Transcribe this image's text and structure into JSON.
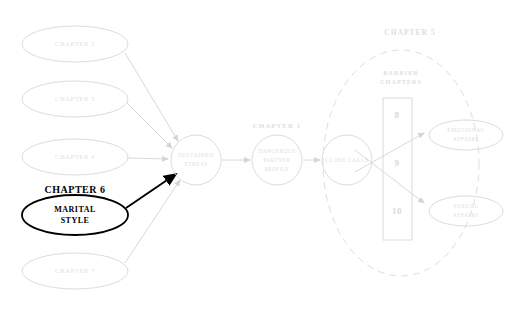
{
  "diagram": {
    "colors": {
      "faint": "#dcdcdc",
      "faint_text": "#e2e2e2",
      "highlight": "#000000",
      "background": "#ffffff"
    },
    "left_inputs": [
      {
        "id": "ch2",
        "label": "CHAPTER 2",
        "cx": 75,
        "cy": 44,
        "rx": 53,
        "ry": 18
      },
      {
        "id": "ch3",
        "label": "CHAPTER 3",
        "cx": 75,
        "cy": 99,
        "rx": 53,
        "ry": 18
      },
      {
        "id": "ch4",
        "label": "CHAPTER 4",
        "cx": 75,
        "cy": 157,
        "rx": 53,
        "ry": 18
      },
      {
        "id": "ch7",
        "label": "CHAPTER 7",
        "cx": 75,
        "cy": 271,
        "rx": 53,
        "ry": 18
      }
    ],
    "highlight_node": {
      "heading": "CHAPTER 6",
      "line1": "MARITAL",
      "line2": "STYLE",
      "cx": 75,
      "cy": 215,
      "rx": 53,
      "ry": 20
    },
    "core_nodes": [
      {
        "id": "sustained-stress",
        "lines": [
          "SUSTAINED",
          "STRESS"
        ],
        "cx": 196,
        "cy": 160,
        "r": 25,
        "chapter": ""
      },
      {
        "id": "dangerous-partner-profile",
        "lines": [
          "DANGEROUS",
          "PARTNER",
          "PROFILE"
        ],
        "cx": 277,
        "cy": 160,
        "r": 25,
        "chapter": "CHAPTER 1"
      },
      {
        "id": "close-calls",
        "lines": [
          "CLOSE CALLS"
        ],
        "cx": 347,
        "cy": 160,
        "r": 25,
        "chapter": ""
      }
    ],
    "cluster": {
      "label": "CHAPTER 5",
      "label_x": 410,
      "label_y": 33,
      "cx": 401,
      "cy": 163,
      "rx": 78,
      "ry": 113
    },
    "barrier": {
      "heading_line1": "BARRIER",
      "heading_line2": "CHAPTERS",
      "heading_x": 401,
      "heading_y": 78,
      "box_x": 383,
      "box_y": 98,
      "box_w": 29,
      "box_h": 142,
      "numbers": [
        {
          "value": "8",
          "x": 397,
          "y": 116
        },
        {
          "value": "9",
          "x": 397,
          "y": 164
        },
        {
          "value": "10",
          "x": 397,
          "y": 212
        }
      ]
    },
    "outcomes": [
      {
        "id": "emotional-affairs",
        "line1": "EMOTIONAL",
        "line2": "AFFAIRS",
        "cx": 466,
        "cy": 135,
        "rx": 37,
        "ry": 15
      },
      {
        "id": "sexual-affairs",
        "line1": "SEXUAL",
        "line2": "AFFAIRS",
        "cx": 466,
        "cy": 211,
        "rx": 37,
        "ry": 15
      }
    ]
  }
}
